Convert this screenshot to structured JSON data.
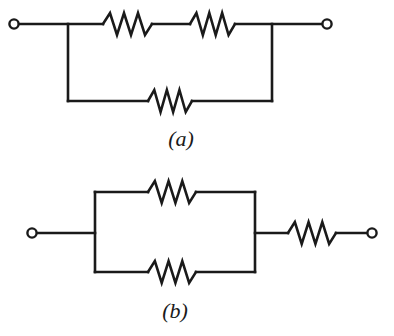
{
  "figure": {
    "background_color": "#ffffff",
    "line_color": "#1a1a1a",
    "line_width": 2.6,
    "terminal_radius": 4.6,
    "terminal_stroke": 2.4,
    "caption_font_size": 22
  },
  "circuits": [
    {
      "id": "a",
      "caption": "(a)",
      "caption_x": 181,
      "caption_y": 146,
      "description": "Two resistors in series on the upper branch, in parallel with a single resistor on the lower branch.",
      "terminals": [
        {
          "name": "left-terminal",
          "cx": 14,
          "cy": 24
        },
        {
          "name": "right-terminal",
          "cx": 327,
          "cy": 24
        }
      ],
      "wires": [
        {
          "name": "left-lead",
          "points": "19,24 103,24"
        },
        {
          "name": "top-mid-wire",
          "points": "152,24 190,24"
        },
        {
          "name": "right-lead",
          "points": "235,24 322,24"
        },
        {
          "name": "left-rail",
          "points": "68,24 68,101"
        },
        {
          "name": "right-rail",
          "points": "272,24 272,101"
        },
        {
          "name": "bottom-left-wire",
          "points": "68,101 148,101"
        },
        {
          "name": "bottom-right-wire",
          "points": "192,101 272,101"
        }
      ],
      "resistors": [
        {
          "name": "resistor-top-left",
          "x1": 103,
          "x2": 152,
          "y": 24,
          "amplitude": 11,
          "zigs": 6
        },
        {
          "name": "resistor-top-right",
          "x1": 190,
          "x2": 235,
          "y": 24,
          "amplitude": 11,
          "zigs": 6
        },
        {
          "name": "resistor-bottom",
          "x1": 148,
          "x2": 192,
          "y": 101,
          "amplitude": 11,
          "zigs": 6
        }
      ]
    },
    {
      "id": "b",
      "caption": "(b)",
      "caption_x": 175,
      "caption_y": 318,
      "description": "Two resistors in parallel, in series with a third resistor on the right lead.",
      "terminals": [
        {
          "name": "left-terminal",
          "cx": 32,
          "cy": 233
        },
        {
          "name": "right-terminal",
          "cx": 372,
          "cy": 233
        }
      ],
      "wires": [
        {
          "name": "left-lead",
          "points": "37,233 95,233"
        },
        {
          "name": "left-rail",
          "points": "95,192 95,272"
        },
        {
          "name": "right-rail",
          "points": "255,192 255,272"
        },
        {
          "name": "top-left-wire",
          "points": "95,192 148,192"
        },
        {
          "name": "top-right-wire",
          "points": "196,192 255,192"
        },
        {
          "name": "bottom-left-wire",
          "points": "95,272 148,272"
        },
        {
          "name": "bottom-right-wire",
          "points": "196,272 255,272"
        },
        {
          "name": "mid-right-lead",
          "points": "255,233 288,233"
        },
        {
          "name": "right-lead",
          "points": "336,233 367,233"
        }
      ],
      "resistors": [
        {
          "name": "resistor-parallel-top",
          "x1": 148,
          "x2": 196,
          "y": 192,
          "amplitude": 11,
          "zigs": 6
        },
        {
          "name": "resistor-parallel-bottom",
          "x1": 148,
          "x2": 196,
          "y": 272,
          "amplitude": 11,
          "zigs": 6
        },
        {
          "name": "resistor-series-right",
          "x1": 288,
          "x2": 336,
          "y": 233,
          "amplitude": 11,
          "zigs": 6
        }
      ]
    }
  ]
}
